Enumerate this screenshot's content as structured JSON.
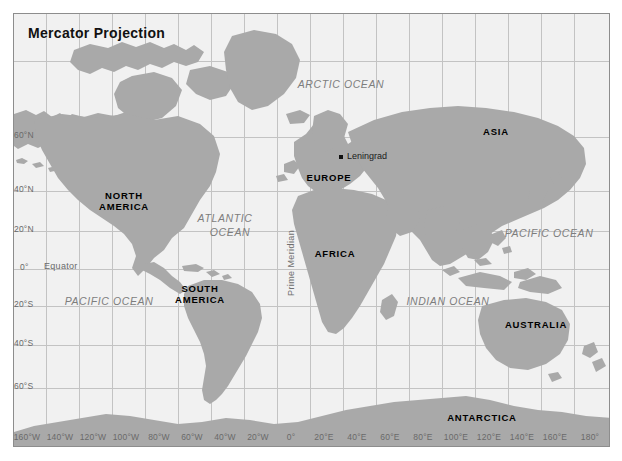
{
  "map": {
    "title": "Mercator Projection",
    "projection_type": "Mercator",
    "background_color": "#f1f1f1",
    "land_color": "#a9a9a9",
    "grid_color": "#c3c3c3",
    "frame_color": "#8d8d8d",
    "text_color": "#6a6a6a"
  },
  "continents": [
    {
      "label": "NORTH\nAMERICA",
      "line1": "NORTH",
      "line2": "AMERICA"
    },
    {
      "label": "SOUTH\nAMERICA",
      "line1": "SOUTH",
      "line2": "AMERICA"
    },
    {
      "label": "EUROPE",
      "line1": "EUROPE",
      "line2": ""
    },
    {
      "label": "AFRICA",
      "line1": "AFRICA",
      "line2": ""
    },
    {
      "label": "ASIA",
      "line1": "ASIA",
      "line2": ""
    },
    {
      "label": "AUSTRALIA",
      "line1": "AUSTRALIA",
      "line2": ""
    },
    {
      "label": "ANTARCTICA",
      "line1": "ANTARCTICA",
      "line2": ""
    }
  ],
  "labels": {
    "north_america_1": "NORTH",
    "north_america_2": "AMERICA",
    "south_america_1": "SOUTH",
    "south_america_2": "AMERICA",
    "europe": "EUROPE",
    "africa": "AFRICA",
    "asia": "ASIA",
    "australia": "AUSTRALIA",
    "antarctica": "ANTARCTICA"
  },
  "oceans": {
    "arctic": "ARCTIC OCEAN",
    "atlantic_1": "ATLANTIC",
    "atlantic_2": "OCEAN",
    "pacific_west": "PACIFIC OCEAN",
    "pacific_east": "PACIFIC OCEAN",
    "indian": "INDIAN OCEAN"
  },
  "annotations": {
    "equator": "Equator",
    "prime_meridian": "Prime Meridian"
  },
  "cities": [
    {
      "name": "Leningrad"
    }
  ],
  "city_names": {
    "leningrad": "Leningrad"
  },
  "axes": {
    "latitude_labels": [
      "60°N",
      "40°N",
      "20°N",
      "0°",
      "20°S",
      "40°S",
      "60°S"
    ],
    "longitude_labels": [
      "160°W",
      "140°W",
      "120°W",
      "100°W",
      "80°W",
      "60°W",
      "40°W",
      "20°W",
      "0°",
      "20°E",
      "40°E",
      "60°E",
      "80°E",
      "100°E",
      "120°E",
      "140°E",
      "160°E",
      "180°"
    ],
    "latitude_interval_deg": 20,
    "longitude_interval_deg": 20
  }
}
